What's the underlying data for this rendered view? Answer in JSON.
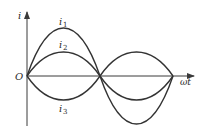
{
  "diagram": {
    "title": "",
    "axes": {
      "y_label": "i",
      "x_label": "ωt",
      "origin_label": "O"
    },
    "curves": [
      {
        "id": "i1",
        "label_main": "i",
        "label_sub": "1",
        "amplitude": 2,
        "phase": "in-phase"
      },
      {
        "id": "i2",
        "label_main": "i",
        "label_sub": "2",
        "amplitude": 1,
        "phase": "in-phase"
      },
      {
        "id": "i3",
        "label_main": "i",
        "label_sub": "3",
        "amplitude": 1,
        "phase": "anti-phase"
      }
    ],
    "colors": {
      "line": "#333333",
      "background": "#ffffff"
    }
  }
}
